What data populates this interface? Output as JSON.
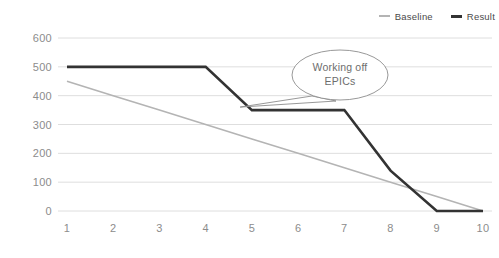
{
  "chart_data": {
    "type": "line",
    "title": "",
    "subtitle": "",
    "xlabel": "",
    "ylabel": "",
    "x": [
      1,
      2,
      3,
      4,
      5,
      6,
      7,
      8,
      9,
      10
    ],
    "xticklabels": [
      "1",
      "2",
      "3",
      "4",
      "5",
      "6",
      "7",
      "8",
      "9",
      "10"
    ],
    "yticklabels": [
      "0",
      "100",
      "200",
      "300",
      "400",
      "500",
      "600"
    ],
    "yticks": [
      0,
      100,
      200,
      300,
      400,
      500,
      600
    ],
    "xlim": [
      1,
      10
    ],
    "ylim": [
      0,
      600
    ],
    "grid": "horizontal",
    "legend_position": "top-right",
    "series": [
      {
        "name": "Baseline",
        "color": "#b4b4b4",
        "width": 1.6,
        "values": [
          450,
          400,
          350,
          300,
          250,
          200,
          150,
          100,
          50,
          0
        ]
      },
      {
        "name": "Result",
        "color": "#333333",
        "width": 2.6,
        "values": [
          500,
          500,
          500,
          500,
          350,
          350,
          350,
          140,
          0,
          0
        ]
      }
    ],
    "annotations": [
      {
        "text_line1": "Working off",
        "text_line2": "EPICs",
        "shape": "speech-bubble",
        "points_to_x": 6.0,
        "points_to_y": 350
      }
    ]
  },
  "legend": {
    "items": [
      {
        "label": "Baseline",
        "swatch": "baseline"
      },
      {
        "label": "Result",
        "swatch": "result"
      }
    ]
  }
}
